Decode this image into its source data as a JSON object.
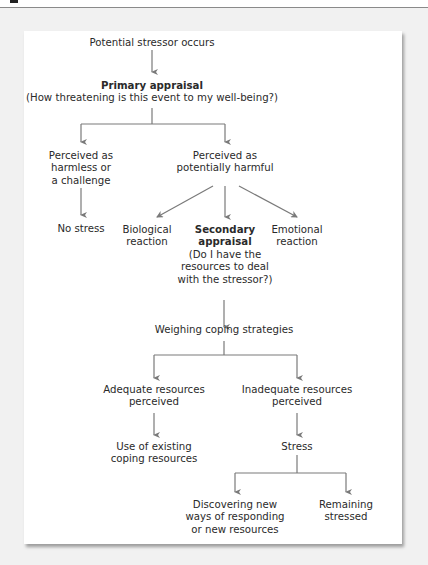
{
  "figure": {
    "background_color": "#f1f1f1",
    "card_color": "#ffffff",
    "line_color": "#7a7a7a",
    "text_color": "#2a2a2a"
  },
  "nodes": {
    "stressor": {
      "lines": [
        "Potential stressor occurs"
      ]
    },
    "primary": {
      "title": "Primary appraisal",
      "lines": [
        "(How threatening is this event to my well-being?)"
      ]
    },
    "harmless": {
      "lines": [
        "Perceived as",
        "harmless or",
        "a challenge"
      ]
    },
    "harmful": {
      "lines": [
        "Perceived as",
        "potentially harmful"
      ]
    },
    "no_stress": {
      "lines": [
        "No stress"
      ]
    },
    "biological": {
      "lines": [
        "Biological",
        "reaction"
      ]
    },
    "secondary": {
      "title_lines": [
        "Secondary",
        "appraisal"
      ],
      "lines": [
        "(Do I have the",
        "resources to deal",
        "with the stressor?)"
      ]
    },
    "emotional": {
      "lines": [
        "Emotional",
        "reaction"
      ]
    },
    "weighing": {
      "lines": [
        "Weighing coping strategies"
      ]
    },
    "adequate": {
      "lines": [
        "Adequate resources",
        "perceived"
      ]
    },
    "inadequate": {
      "lines": [
        "Inadequate resources",
        "perceived"
      ]
    },
    "existing": {
      "lines": [
        "Use of existing",
        "coping resources"
      ]
    },
    "stress": {
      "lines": [
        "Stress"
      ]
    },
    "discovering": {
      "lines": [
        "Discovering new",
        "ways of responding",
        "or new resources"
      ]
    },
    "remaining": {
      "lines": [
        "Remaining",
        "stressed"
      ]
    }
  }
}
